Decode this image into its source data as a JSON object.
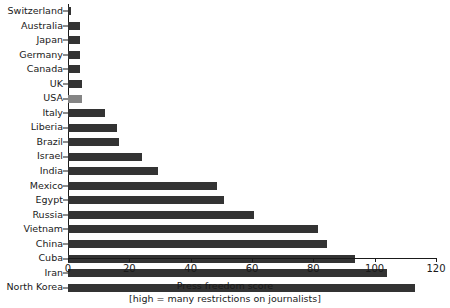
{
  "chart_data": {
    "type": "bar",
    "orientation": "horizontal",
    "title": "",
    "xlabel": "Press freedom score",
    "xlabel_note": "[high = many restrictions on journalists]",
    "ylabel": "",
    "xlim": [
      0,
      120
    ],
    "xticks": [
      0,
      20,
      40,
      60,
      80,
      100,
      120
    ],
    "grid": false,
    "legend": false,
    "bar_color": "#333333",
    "highlight_color": "#858585",
    "highlighted_category": "USA",
    "categories": [
      "Switzerland",
      "Australia",
      "Japan",
      "Germany",
      "Canada",
      "UK",
      "USA",
      "Italy",
      "Liberia",
      "Brazil",
      "Israel",
      "India",
      "Mexico",
      "Egypt",
      "Russia",
      "Vietnam",
      "China",
      "Cuba",
      "Iran",
      "North Korea"
    ],
    "values": [
      1,
      4,
      4,
      4,
      4,
      4.5,
      4.5,
      12,
      16,
      16.5,
      24,
      29.5,
      48.5,
      51,
      60.5,
      81.5,
      84.5,
      93.5,
      104,
      113
    ]
  }
}
